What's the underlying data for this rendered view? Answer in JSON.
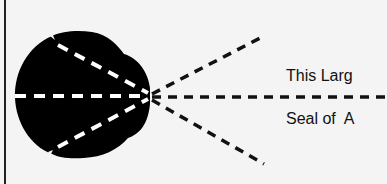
{
  "diagram": {
    "label_top": "This Larg",
    "label_bottom": "Seal of  A",
    "colors": {
      "background": "#f4f4f4",
      "seal_fill": "#000000",
      "dash_inner": "#ffffff",
      "dash_outer": "#111111",
      "border": "#222222"
    },
    "icons": [
      "seal-silhouette-icon",
      "dashed-ray-lines"
    ]
  }
}
